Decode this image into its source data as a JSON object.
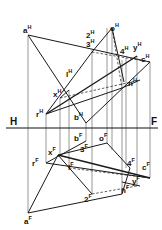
{
  "figure": {
    "type": "descriptive geometry - intersection of two planes (horizontal and frontal projections)",
    "fold_line": {
      "left_label": "H",
      "right_label": "F"
    },
    "horizontal_view_labels": [
      {
        "id": "aH",
        "base": "a",
        "sup": "H"
      },
      {
        "id": "2H",
        "base": "2",
        "sup": "H"
      },
      {
        "id": "3H",
        "base": "3",
        "sup": "H"
      },
      {
        "id": "oH",
        "base": "o",
        "sup": "H"
      },
      {
        "id": "4H",
        "base": "4",
        "sup": "H"
      },
      {
        "id": "yH",
        "base": "y",
        "sup": "H"
      },
      {
        "id": "cH",
        "base": "c",
        "sup": "H"
      },
      {
        "id": "1H",
        "base": "l",
        "sup": "H"
      },
      {
        "id": "xH",
        "base": "x",
        "sup": "H"
      },
      {
        "id": "nH",
        "base": "n",
        "sup": "H"
      },
      {
        "id": "rH",
        "base": "r",
        "sup": "H"
      },
      {
        "id": "bH",
        "base": "b",
        "sup": "H"
      }
    ],
    "frontal_view_labels": [
      {
        "id": "bF",
        "base": "b",
        "sup": "F"
      },
      {
        "id": "oF",
        "base": "o",
        "sup": "F"
      },
      {
        "id": "xF",
        "base": "x",
        "sup": "F"
      },
      {
        "id": "3F",
        "base": "3",
        "sup": "F"
      },
      {
        "id": "rF",
        "base": "r",
        "sup": "F"
      },
      {
        "id": "1F",
        "base": "l",
        "sup": "F"
      },
      {
        "id": "4F",
        "base": "4",
        "sup": "F"
      },
      {
        "id": "cF",
        "base": "c",
        "sup": "F"
      },
      {
        "id": "yF",
        "base": "y",
        "sup": "F"
      },
      {
        "id": "nF",
        "base": "n",
        "sup": "F"
      },
      {
        "id": "2F",
        "base": "2",
        "sup": "F"
      },
      {
        "id": "aF",
        "base": "a",
        "sup": "F"
      }
    ]
  }
}
